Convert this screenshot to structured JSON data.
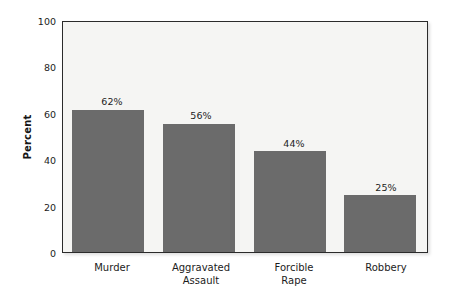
{
  "chart_data": {
    "type": "bar",
    "title": "",
    "subtitle": "",
    "xlabel": "",
    "ylabel": "Percent",
    "categories": [
      "Murder",
      "Aggravated\nAssault",
      "Forcible\nRape",
      "Robbery"
    ],
    "values": [
      62,
      56,
      44,
      25
    ],
    "data_labels": [
      "62%",
      "56%",
      "44%",
      "25%"
    ],
    "ylim": [
      0,
      100
    ],
    "yticks": [
      0,
      20,
      40,
      60,
      80,
      100
    ],
    "ytick_labels": [
      "0",
      "20",
      "40",
      "60",
      "80",
      "100"
    ],
    "grid": false,
    "legend": null,
    "bar_color": "#6b6b6b",
    "plot_background": "#f5f5f3",
    "frame_color": "#2b2b2b",
    "page_background": "#ffffff"
  }
}
